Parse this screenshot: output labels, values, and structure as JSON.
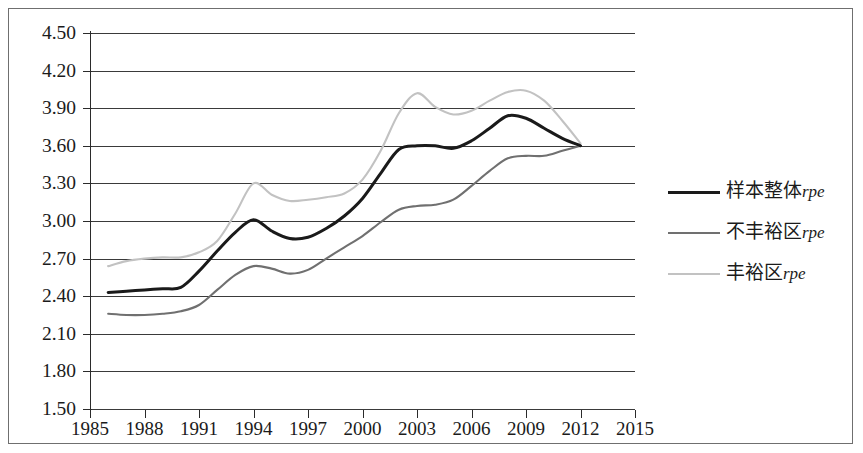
{
  "chart_data": {
    "type": "line",
    "title": "",
    "subtitle": "",
    "xlabel": "",
    "ylabel": "",
    "xlim": [
      1985,
      2015
    ],
    "ylim": [
      1.5,
      4.5
    ],
    "grid": true,
    "legend_position": "right",
    "x_tick_labels": [
      "1985",
      "1988",
      "1991",
      "1994",
      "1997",
      "2000",
      "2003",
      "2006",
      "2009",
      "2012",
      "2015"
    ],
    "x_ticks": [
      1985,
      1988,
      1991,
      1994,
      1997,
      2000,
      2003,
      2006,
      2009,
      2012,
      2015
    ],
    "y_tick_labels": [
      "4.50",
      "4.20",
      "3.90",
      "3.60",
      "3.30",
      "3.00",
      "2.70",
      "2.40",
      "2.10",
      "1.80",
      "1.50"
    ],
    "y_ticks": [
      4.5,
      4.2,
      3.9,
      3.6,
      3.3,
      3.0,
      2.7,
      2.4,
      2.1,
      1.8,
      1.5
    ],
    "x": [
      1986,
      1987,
      1988,
      1989,
      1990,
      1991,
      1992,
      1993,
      1994,
      1995,
      1996,
      1997,
      1998,
      1999,
      2000,
      2001,
      2002,
      2003,
      2004,
      2005,
      2006,
      2007,
      2008,
      2009,
      2010,
      2011,
      2012
    ],
    "series": [
      {
        "name": "样本整体rpe",
        "name_cjk": "样本整体",
        "name_italic": "rpe",
        "color": "#1a1a1a",
        "width": 3.0,
        "values": [
          2.43,
          2.44,
          2.45,
          2.46,
          2.47,
          2.6,
          2.76,
          2.91,
          3.01,
          2.92,
          2.86,
          2.87,
          2.94,
          3.04,
          3.18,
          3.38,
          3.57,
          3.6,
          3.6,
          3.58,
          3.64,
          3.74,
          3.84,
          3.82,
          3.74,
          3.66,
          3.6
        ]
      },
      {
        "name": "不丰裕区rpe",
        "name_cjk": "不丰裕区",
        "name_italic": "rpe",
        "color": "#707070",
        "width": 2.1,
        "values": [
          2.26,
          2.25,
          2.25,
          2.26,
          2.28,
          2.33,
          2.45,
          2.57,
          2.64,
          2.62,
          2.58,
          2.61,
          2.7,
          2.79,
          2.88,
          2.99,
          3.09,
          3.12,
          3.13,
          3.17,
          3.28,
          3.4,
          3.5,
          3.52,
          3.52,
          3.56,
          3.6
        ]
      },
      {
        "name": "丰裕区rpe",
        "name_cjk": "丰裕区",
        "name_italic": "rpe",
        "color": "#c2c2c2",
        "width": 2.1,
        "values": [
          2.64,
          2.68,
          2.7,
          2.71,
          2.71,
          2.75,
          2.84,
          3.06,
          3.3,
          3.21,
          3.16,
          3.17,
          3.19,
          3.22,
          3.33,
          3.56,
          3.86,
          4.02,
          3.91,
          3.85,
          3.88,
          3.96,
          4.03,
          4.04,
          3.96,
          3.8,
          3.62
        ]
      }
    ]
  },
  "legend": {
    "entries": [
      {
        "cjk": "样本整体",
        "italic": "rpe"
      },
      {
        "cjk": "不丰裕区",
        "italic": "rpe"
      },
      {
        "cjk": "丰裕区",
        "italic": "rpe"
      }
    ]
  }
}
